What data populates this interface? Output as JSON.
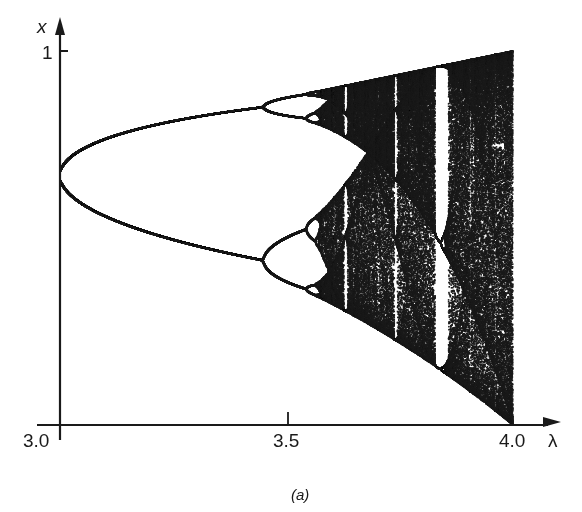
{
  "chart_data": {
    "type": "scatter",
    "title": "",
    "subtitle": "Bifurcation diagram of the logistic map x -> lambda x (1 - x)",
    "caption": "(a)",
    "xlabel": "λ",
    "ylabel": "x",
    "xlim": [
      3.0,
      4.0
    ],
    "ylim": [
      0,
      1
    ],
    "x_ticks": [
      {
        "value": 3.0,
        "label": "3.0"
      },
      {
        "value": 3.5,
        "label": "3.5"
      },
      {
        "value": 4.0,
        "label": "4.0"
      }
    ],
    "y_ticks": [
      {
        "value": 1,
        "label": "1"
      }
    ],
    "grid": false,
    "legend": null,
    "series": [
      {
        "name": "attractor points",
        "map": "logistic",
        "lambda_range": [
          3.0,
          4.0
        ],
        "lambda_steps": 1400,
        "transient_iterations": 300,
        "plotted_iterations": 160,
        "features": {
          "period_2_onset": 3.0,
          "period_4_onset": 3.449,
          "period_8_onset": 3.544,
          "chaos_onset": 3.57,
          "period_3_window": [
            3.828,
            3.857
          ],
          "upper_branch_at_3_45": 0.85,
          "lower_branch_at_3_45": 0.44,
          "fixed_point_at_3_0": 0.667,
          "max_x_at_4_0": 1.0,
          "min_x_at_4_0": 0.0
        }
      }
    ],
    "colors": {
      "points": "#1a1a1a",
      "axes": "#1a1a1a",
      "background": "#ffffff"
    }
  }
}
